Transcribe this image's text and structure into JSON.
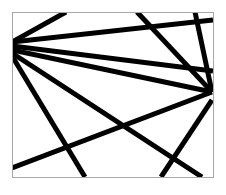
{
  "diagram": {
    "width": 226,
    "height": 195,
    "frame": {
      "x": 12,
      "y": 12,
      "width": 201,
      "height": 165,
      "stroke": "#a8a8a8",
      "stroke_width": 1
    },
    "line_color": "#000000",
    "line_width": 5,
    "lines": [
      {
        "x1": 12,
        "y1": 42,
        "x2": 66,
        "y2": 12
      },
      {
        "x1": 12,
        "y1": 42,
        "x2": 213,
        "y2": 20
      },
      {
        "x1": 12,
        "y1": 46,
        "x2": 213,
        "y2": 71
      },
      {
        "x1": 12,
        "y1": 50,
        "x2": 212,
        "y2": 92
      },
      {
        "x1": 12,
        "y1": 56,
        "x2": 85,
        "y2": 177
      },
      {
        "x1": 12,
        "y1": 53,
        "x2": 202,
        "y2": 177
      },
      {
        "x1": 137,
        "y1": 12,
        "x2": 212,
        "y2": 92
      },
      {
        "x1": 195,
        "y1": 12,
        "x2": 212,
        "y2": 92
      },
      {
        "x1": 12,
        "y1": 168,
        "x2": 212,
        "y2": 92
      },
      {
        "x1": 212,
        "y1": 100,
        "x2": 161,
        "y2": 177
      }
    ]
  }
}
